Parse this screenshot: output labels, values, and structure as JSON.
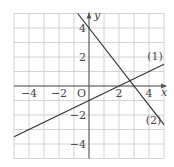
{
  "chart_data": {
    "type": "line",
    "title": "",
    "xlabel": "x",
    "ylabel": "y",
    "origin_label": "O",
    "xlim": [
      -5,
      5
    ],
    "ylim": [
      -5,
      5
    ],
    "grid": true,
    "grid_step": 1,
    "x_ticks": [
      {
        "value": -4,
        "label": "−4"
      },
      {
        "value": -2,
        "label": "−2"
      },
      {
        "value": 2,
        "label": "2"
      },
      {
        "value": 4,
        "label": "4"
      }
    ],
    "y_ticks": [
      {
        "value": 4,
        "label": "4"
      },
      {
        "value": 2,
        "label": "2"
      },
      {
        "value": -2,
        "label": "−2"
      },
      {
        "value": -4,
        "label": "−4"
      }
    ],
    "series": [
      {
        "name": "(1)",
        "equation": "y = 0.5x - 1",
        "slope": 0.5,
        "intercept": -1,
        "x": [
          -5,
          5
        ],
        "y": [
          -3.5,
          1.5
        ],
        "label_pos": [
          4.4,
          1.8
        ]
      },
      {
        "name": "(2)",
        "equation": "y = -4/3 x + 4",
        "slope": -1.3333,
        "intercept": 4,
        "x": [
          -0.75,
          5
        ],
        "y": [
          5,
          -2.667
        ],
        "label_pos": [
          4.3,
          -2.6
        ]
      }
    ],
    "intersection": {
      "x": 2.73,
      "y": 0.36
    }
  }
}
